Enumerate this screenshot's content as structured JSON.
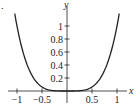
{
  "chart_data": {
    "type": "line",
    "title": "",
    "xlabel": "x",
    "ylabel": "y",
    "function": "y = x^4",
    "xlim": [
      -1.05,
      1.05
    ],
    "ylim": [
      0,
      1.2
    ],
    "grid": false,
    "legend": null,
    "x_ticks": [
      -1,
      -0.5,
      0.5,
      1
    ],
    "x_tick_labels": [
      "−1",
      "−0.5",
      "0.5",
      "1"
    ],
    "y_ticks": [
      0.2,
      0.4,
      0.6,
      0.8,
      1
    ],
    "y_tick_labels": [
      "0.2",
      "0.4",
      "0.6",
      "0.8",
      "1"
    ],
    "series": [
      {
        "name": "y = x^4",
        "x": [
          -1.04,
          -1,
          -0.9,
          -0.8,
          -0.7,
          -0.6,
          -0.5,
          -0.4,
          -0.3,
          -0.2,
          -0.1,
          0,
          0.1,
          0.2,
          0.3,
          0.4,
          0.5,
          0.6,
          0.7,
          0.8,
          0.9,
          1,
          1.04
        ],
        "values": [
          1.17,
          1,
          0.656,
          0.41,
          0.24,
          0.13,
          0.0625,
          0.0256,
          0.0081,
          0.0016,
          0.0001,
          0,
          0.0001,
          0.0016,
          0.0081,
          0.0256,
          0.0625,
          0.13,
          0.24,
          0.41,
          0.656,
          1,
          1.17
        ]
      }
    ],
    "line_color": "#222222"
  },
  "labels": {
    "x_axis": "x",
    "y_axis": "y",
    "corner_mark": "."
  }
}
